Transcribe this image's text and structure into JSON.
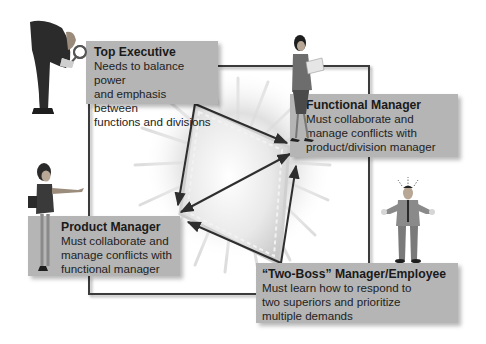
{
  "diagram": {
    "type": "matrix-structure-roles",
    "colors": {
      "box_fill": "#b5b5b5",
      "line": "#3a3a3a",
      "center_fill": "#e6e6e6",
      "burst": "#d4d4d4"
    },
    "roles": [
      {
        "id": "top-executive",
        "title": "Top Executive",
        "description": "Needs to balance power\nand emphasis between\nfunctions and divisions",
        "figure": "executive-with-magnifying-glass"
      },
      {
        "id": "functional-manager",
        "title": "Functional Manager",
        "description": "Must collaborate and\nmanage conflicts with\nproduct/division manager",
        "figure": "woman-reading-document"
      },
      {
        "id": "product-manager",
        "title": "Product Manager",
        "description": "Must collaborate and\nmanage conflicts with\nfunctional manager",
        "figure": "woman-pointing"
      },
      {
        "id": "two-boss-manager",
        "title": "“Two-Boss” Manager/Employee",
        "description": "Must learn how to respond to\ntwo superiors and prioritize\nmultiple demands",
        "figure": "stressed-man-shrugging"
      }
    ],
    "connections": [
      {
        "from": "top-executive",
        "to": "functional-manager",
        "arrow": "to"
      },
      {
        "from": "top-executive",
        "to": "product-manager",
        "arrow": "to"
      },
      {
        "from": "functional-manager",
        "to": "product-manager",
        "arrow": "both"
      },
      {
        "from": "two-boss-manager",
        "to": "functional-manager",
        "arrow": "to"
      },
      {
        "from": "two-boss-manager",
        "to": "product-manager",
        "arrow": "to"
      }
    ]
  }
}
